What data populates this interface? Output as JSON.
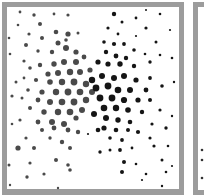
{
  "figure": {
    "colors": {
      "frame": "#9c9c9c",
      "background": "#ffffff",
      "gray_dots": "#4a4a4a",
      "black_dots": "#151515"
    },
    "panels": [
      {
        "id": "main",
        "x": 2,
        "y": 2,
        "w": 182,
        "h": 193
      },
      {
        "id": "next-partial",
        "x": 193,
        "y": 2,
        "w": 40,
        "h": 193
      }
    ],
    "dots_gray": [
      [
        20,
        12,
        1.4
      ],
      [
        34,
        15,
        1.7
      ],
      [
        54,
        14,
        1.4
      ],
      [
        68,
        15,
        1.6
      ],
      [
        18,
        25,
        1.3
      ],
      [
        40,
        24,
        2
      ],
      [
        56,
        32,
        2.3
      ],
      [
        68,
        34,
        2.6
      ],
      [
        78,
        33,
        1.5
      ],
      [
        29,
        34,
        1.6
      ],
      [
        9,
        38,
        1.3
      ],
      [
        42,
        38,
        2
      ],
      [
        58,
        43,
        2.5
      ],
      [
        66,
        48,
        3
      ],
      [
        76,
        52,
        2.6
      ],
      [
        26,
        45,
        2
      ],
      [
        38,
        51,
        1.7
      ],
      [
        52,
        52,
        2.2
      ],
      [
        10,
        54,
        1.3
      ],
      [
        24,
        61,
        1.6
      ],
      [
        40,
        65,
        2.2
      ],
      [
        54,
        64,
        2.7
      ],
      [
        64,
        62,
        3
      ],
      [
        76,
        62,
        3
      ],
      [
        84,
        57,
        2.4
      ],
      [
        30,
        68,
        1.8
      ],
      [
        48,
        74,
        2.6
      ],
      [
        58,
        73,
        3
      ],
      [
        70,
        72,
        3.2
      ],
      [
        80,
        72,
        3
      ],
      [
        90,
        70,
        2.6
      ],
      [
        16,
        82,
        1.5
      ],
      [
        36,
        80,
        2.1
      ],
      [
        50,
        82,
        2.8
      ],
      [
        62,
        82,
        3.2
      ],
      [
        74,
        82,
        3.4
      ],
      [
        86,
        84,
        3.2
      ],
      [
        28,
        90,
        1.8
      ],
      [
        42,
        92,
        2.6
      ],
      [
        56,
        92,
        3.2
      ],
      [
        68,
        92,
        3.4
      ],
      [
        80,
        92,
        3.3
      ],
      [
        92,
        92,
        3
      ],
      [
        12,
        96,
        1.6
      ],
      [
        22,
        98,
        1.5
      ],
      [
        38,
        100,
        2.4
      ],
      [
        50,
        102,
        3
      ],
      [
        62,
        102,
        3.3
      ],
      [
        74,
        102,
        3.4
      ],
      [
        86,
        100,
        3.2
      ],
      [
        30,
        108,
        2
      ],
      [
        44,
        112,
        2.7
      ],
      [
        58,
        112,
        3.2
      ],
      [
        70,
        112,
        3.3
      ],
      [
        82,
        110,
        3
      ],
      [
        20,
        120,
        1.6
      ],
      [
        38,
        122,
        2.4
      ],
      [
        52,
        122,
        3
      ],
      [
        64,
        124,
        3
      ],
      [
        76,
        118,
        2.6
      ],
      [
        12,
        124,
        1.3
      ],
      [
        42,
        130,
        2
      ],
      [
        54,
        128,
        2.4
      ],
      [
        68,
        130,
        2.4
      ],
      [
        78,
        132,
        2.2
      ],
      [
        26,
        138,
        1.6
      ],
      [
        50,
        138,
        1.7
      ],
      [
        18,
        148,
        2.6
      ],
      [
        34,
        148,
        2
      ],
      [
        62,
        142,
        2.2
      ],
      [
        70,
        148,
        2
      ],
      [
        56,
        160,
        2
      ],
      [
        9,
        165,
        1.5
      ],
      [
        30,
        163,
        1.6
      ],
      [
        68,
        165,
        1.8
      ],
      [
        44,
        174,
        1.6
      ],
      [
        70,
        170,
        1.8
      ],
      [
        27,
        177,
        1.7
      ],
      [
        58,
        188,
        1.2
      ],
      [
        10,
        185,
        1.2
      ],
      [
        24,
        78,
        1.4
      ],
      [
        66,
        40,
        1.8
      ]
    ],
    "dots_black": [
      [
        114,
        14,
        2.2
      ],
      [
        136,
        18,
        1.4
      ],
      [
        160,
        14,
        1.3
      ],
      [
        146,
        10,
        1
      ],
      [
        122,
        22,
        1.5
      ],
      [
        108,
        28,
        1.6
      ],
      [
        146,
        28,
        1.6
      ],
      [
        170,
        30,
        1.1
      ],
      [
        136,
        36,
        1.1
      ],
      [
        118,
        34,
        1.4
      ],
      [
        104,
        42,
        1.8
      ],
      [
        114,
        44,
        2.1
      ],
      [
        124,
        44,
        1.9
      ],
      [
        156,
        42,
        1.5
      ],
      [
        134,
        50,
        1.8
      ],
      [
        106,
        52,
        2.2
      ],
      [
        116,
        56,
        2.4
      ],
      [
        126,
        58,
        2.2
      ],
      [
        145,
        54,
        1.3
      ],
      [
        160,
        55,
        1.3
      ],
      [
        98,
        62,
        2.6
      ],
      [
        108,
        64,
        2.6
      ],
      [
        120,
        64,
        2.7
      ],
      [
        134,
        66,
        2.2
      ],
      [
        150,
        62,
        1.7
      ],
      [
        172,
        58,
        1.3
      ],
      [
        92,
        80,
        3.2
      ],
      [
        102,
        76,
        3
      ],
      [
        114,
        78,
        3
      ],
      [
        124,
        76,
        3
      ],
      [
        136,
        80,
        2.6
      ],
      [
        150,
        78,
        1.9
      ],
      [
        96,
        88,
        3.4
      ],
      [
        108,
        86,
        3.4
      ],
      [
        118,
        90,
        3.3
      ],
      [
        130,
        90,
        3
      ],
      [
        146,
        90,
        2.4
      ],
      [
        162,
        86,
        1.8
      ],
      [
        174,
        82,
        1.2
      ],
      [
        100,
        98,
        3.4
      ],
      [
        112,
        98,
        3.4
      ],
      [
        124,
        100,
        3.1
      ],
      [
        138,
        100,
        2.6
      ],
      [
        150,
        100,
        2
      ],
      [
        104,
        108,
        3.3
      ],
      [
        116,
        108,
        3.2
      ],
      [
        128,
        110,
        2.8
      ],
      [
        142,
        112,
        2.2
      ],
      [
        160,
        110,
        1.6
      ],
      [
        94,
        114,
        3
      ],
      [
        106,
        118,
        3
      ],
      [
        118,
        120,
        2.7
      ],
      [
        130,
        122,
        2.3
      ],
      [
        152,
        124,
        1.6
      ],
      [
        172,
        116,
        1.2
      ],
      [
        104,
        128,
        2.6
      ],
      [
        116,
        130,
        2.3
      ],
      [
        128,
        130,
        2
      ],
      [
        138,
        132,
        2.1
      ],
      [
        166,
        128,
        1.7
      ],
      [
        98,
        130,
        2.3
      ],
      [
        110,
        138,
        1.8
      ],
      [
        122,
        140,
        1.9
      ],
      [
        150,
        138,
        1.6
      ],
      [
        100,
        152,
        1.7
      ],
      [
        110,
        150,
        1.5
      ],
      [
        120,
        150,
        1.9
      ],
      [
        132,
        148,
        1.4
      ],
      [
        154,
        146,
        1.6
      ],
      [
        168,
        146,
        1.3
      ],
      [
        124,
        162,
        2
      ],
      [
        136,
        164,
        1.3
      ],
      [
        162,
        160,
        1.5
      ],
      [
        172,
        166,
        1.1
      ],
      [
        146,
        174,
        1.3
      ],
      [
        162,
        186,
        1.2
      ],
      [
        166,
        172,
        1.3
      ],
      [
        122,
        172,
        2
      ],
      [
        142,
        180,
        1.1
      ],
      [
        88,
        134,
        1.1
      ]
    ]
  }
}
